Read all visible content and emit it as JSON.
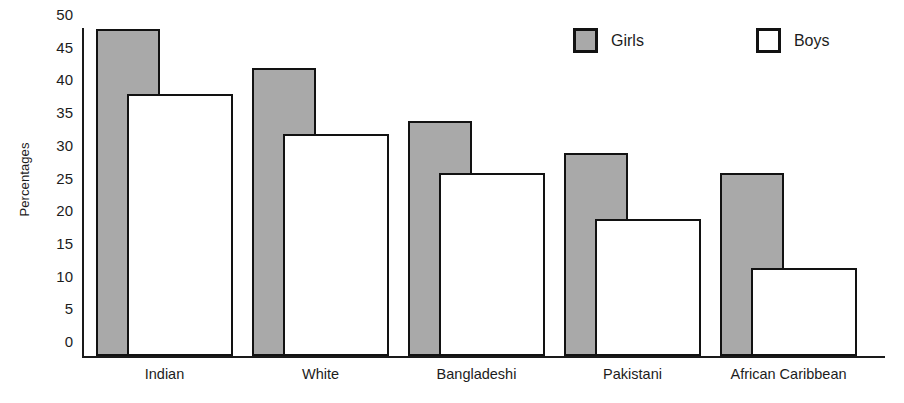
{
  "chart_data": {
    "type": "bar",
    "title": "",
    "subtitle": "",
    "xlabel": "",
    "ylabel": "Percentages",
    "ylim": [
      0,
      50
    ],
    "yticks": [
      0,
      5,
      10,
      15,
      20,
      25,
      30,
      35,
      40,
      45,
      50
    ],
    "ytick_labels": [
      "0",
      "5",
      "10",
      "15",
      "20",
      "25",
      "30",
      "35",
      "40",
      "45",
      "50"
    ],
    "grid": false,
    "legend_position": "top-right",
    "categories": [
      "Indian",
      "White",
      "Bangladeshi",
      "Pakistani",
      "African Caribbean"
    ],
    "series": [
      {
        "name": "Girls",
        "color": "#a9a9a9",
        "values": [
          50,
          44,
          36,
          31,
          28
        ]
      },
      {
        "name": "Boys",
        "color": "#ffffff",
        "values": [
          40,
          34,
          28,
          21,
          13.5
        ]
      }
    ]
  },
  "legend": {
    "items": [
      {
        "label": "Girls",
        "swatch": "gray-filled-square"
      },
      {
        "label": "Boys",
        "swatch": "white-outlined-square"
      }
    ]
  },
  "axes": {
    "y_title": "Percentages"
  }
}
